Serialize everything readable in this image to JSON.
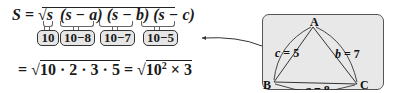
{
  "formula": {
    "lhs": "S",
    "equals": "=",
    "sqrt_symbol": "√",
    "factors": [
      "s",
      "(s − a)",
      "(s − b)",
      "(s − c)"
    ],
    "substitutions": [
      "10",
      "10−8",
      "10−7",
      "10−5"
    ]
  },
  "result_line": {
    "eq1": "=",
    "expr1": "10 · 2 · 3 · 5",
    "eq2": "=",
    "expr2_base": "10",
    "expr2_exp": "2",
    "expr2_rest": " × 3"
  },
  "triangle": {
    "vertices": {
      "A": "A",
      "B": "B",
      "C": "C"
    },
    "sides": {
      "c": {
        "label": "c = 5"
      },
      "b": {
        "label": "b = 7"
      },
      "a": {
        "label": "a = 8"
      }
    },
    "panel_color": "#e8e8e8"
  }
}
